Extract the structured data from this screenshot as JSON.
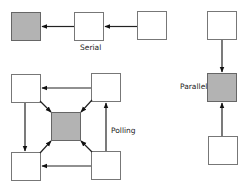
{
  "diagrams": {
    "serial": {
      "label": "Serial"
    },
    "polling": {
      "label": "Polling"
    },
    "parallel": {
      "label": "Parallel"
    }
  },
  "colors": {
    "hub_fill": "#b3b3b3",
    "node_fill": "#ffffff",
    "stroke": "#555555",
    "arrow": "#111111"
  }
}
